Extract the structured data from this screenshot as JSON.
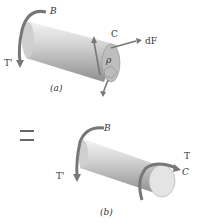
{
  "figure_a": {
    "caption": "(a)",
    "labels": {
      "B": "B",
      "T_prime": "T'",
      "C": "C",
      "dF": "dF",
      "rho": "ρ"
    }
  },
  "equals": "=",
  "figure_b": {
    "caption": "(b)",
    "labels": {
      "B": "B",
      "T_prime": "T'",
      "T": "T",
      "C": "C"
    }
  },
  "colors": {
    "shaft_light": "#e6e6e6",
    "shaft_dark": "#9a9a9a",
    "arrow": "#777777",
    "text": "#333333"
  }
}
